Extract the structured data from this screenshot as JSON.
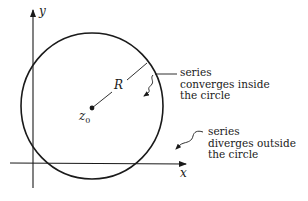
{
  "diagram": {
    "colors": {
      "background": "#ffffff",
      "ink": "#1a1a1a"
    },
    "axes": {
      "x_label": "x",
      "y_label": "y"
    },
    "circle": {
      "center_label": "z",
      "center_subscript": "0",
      "radius_label": "R"
    },
    "annotations": {
      "inside": {
        "lines": [
          "series",
          "converges inside",
          "the circle"
        ]
      },
      "outside": {
        "lines": [
          "series",
          "diverges outside",
          "the circle"
        ]
      }
    }
  }
}
